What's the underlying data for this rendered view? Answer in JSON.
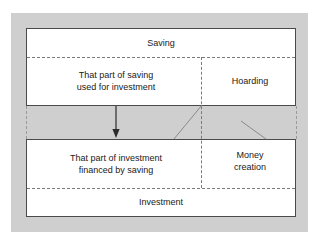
{
  "figure": {
    "type": "block-flow-diagram",
    "background_color": "#cfcfcf",
    "box_fill_color": "#ffffff",
    "line_color": "#4a4a4a",
    "dash_color": "#7a7a7a"
  },
  "saving_block": {
    "band_label": "Saving",
    "left_cell": "That part of saving\nused for investment",
    "left_cell_line1": "That part of saving",
    "left_cell_line2": "used for investment",
    "right_cell": "Hoarding"
  },
  "investment_block": {
    "band_label": "Investment",
    "left_cell_line1": "That part of investment",
    "left_cell_line2": "financed by saving",
    "right_cell_line1": "Money",
    "right_cell_line2": "creation"
  },
  "connectors": {
    "arrow_name": "down-arrow",
    "arrow_direction": "down",
    "tie_left_name": "hoarding-to-money-creation-tie",
    "tie_right_name": "right-edge-tie"
  }
}
